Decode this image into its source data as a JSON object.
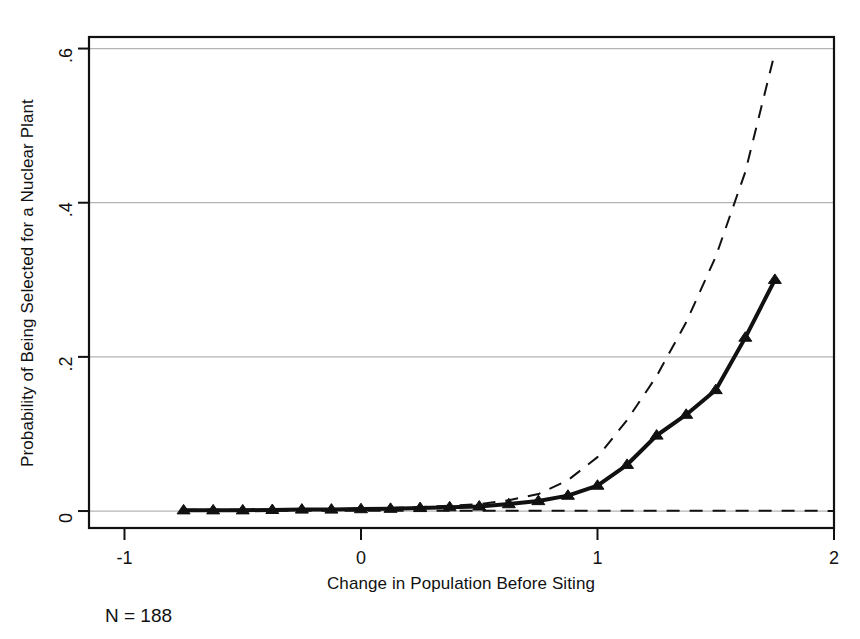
{
  "figure": {
    "background_color": "#ffffff",
    "foreground_color": "#111111",
    "gridline_color": "#b4b4b4",
    "note": "N = 188"
  },
  "chart_data": {
    "type": "line",
    "title": "",
    "subtitle": "",
    "xlabel": "Change in Population Before Siting",
    "ylabel": "Probability of Being Selected for a Nuclear Plant",
    "xlim": [
      -1.15,
      2.0
    ],
    "ylim": [
      -0.022,
      0.615
    ],
    "xticks": [
      -1,
      0,
      1,
      2
    ],
    "xticklabels": [
      "-1",
      "0",
      "1",
      "2"
    ],
    "yticks": [
      0,
      0.2,
      0.4,
      0.6
    ],
    "yticklabels": [
      "0",
      ".2",
      ".4",
      ".6"
    ],
    "grid": "horizontal",
    "legend": "none",
    "annotations": [
      "N = 188"
    ],
    "series": [
      {
        "name": "Predicted probability",
        "style": "solid",
        "marker": "triangle",
        "linewidth": 4,
        "color": "#111111",
        "x": [
          -0.75,
          -0.625,
          -0.5,
          -0.375,
          -0.25,
          -0.125,
          0.0,
          0.125,
          0.25,
          0.375,
          0.5,
          0.625,
          0.75,
          0.875,
          1.0,
          1.125,
          1.25,
          1.375,
          1.5,
          1.625,
          1.75
        ],
        "y": [
          0.001,
          0.001,
          0.001,
          0.0015,
          0.002,
          0.002,
          0.0025,
          0.003,
          0.004,
          0.005,
          0.006,
          0.009,
          0.013,
          0.02,
          0.033,
          0.06,
          0.098,
          0.125,
          0.157,
          0.225,
          0.3
        ]
      },
      {
        "name": "Upper confidence bound",
        "style": "dashed",
        "marker": "none",
        "linewidth": 2,
        "color": "#111111",
        "x": [
          -0.75,
          -0.25,
          0.0,
          0.25,
          0.5,
          0.625,
          0.75,
          0.875,
          1.0,
          1.125,
          1.25,
          1.375,
          1.5,
          1.625,
          1.75
        ],
        "y": [
          0.0015,
          0.002,
          0.003,
          0.005,
          0.009,
          0.014,
          0.022,
          0.04,
          0.07,
          0.118,
          0.175,
          0.245,
          0.33,
          0.44,
          0.595
        ]
      },
      {
        "name": "Lower confidence bound",
        "style": "dashed",
        "marker": "none",
        "linewidth": 2,
        "color": "#111111",
        "x": [
          -0.75,
          0.0,
          0.5,
          0.75,
          1.0,
          1.25,
          1.5,
          1.75,
          2.0
        ],
        "y": [
          0.0005,
          0.0005,
          0.0005,
          0.0005,
          0.0005,
          0.0004,
          0.0003,
          0.0003,
          0.0002
        ]
      }
    ]
  }
}
